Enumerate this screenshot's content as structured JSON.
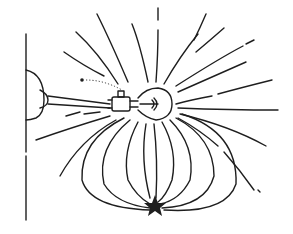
{
  "diagram": {
    "colors": {
      "ink": "#1e1e1e",
      "background": "#ffffff"
    },
    "elements": {
      "wall": "vertical-wall-line",
      "mount": "wall-mount-dome",
      "arm": "bulb-arm",
      "socket": "bulb-socket",
      "bulb": "light-bulb",
      "star": "star-point",
      "pointer": "dotted-pointer"
    }
  }
}
